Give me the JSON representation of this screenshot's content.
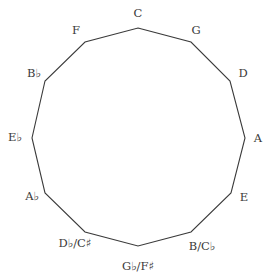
{
  "stroke_color": "#3a3a3a",
  "nodes": [
    {
      "label": "C",
      "x": 138,
      "y": 28,
      "lx": 138,
      "ly": 17
    },
    {
      "label": "G",
      "x": 191,
      "y": 42,
      "lx": 196,
      "ly": 34
    },
    {
      "label": "D",
      "x": 230,
      "y": 81,
      "lx": 243,
      "ly": 77
    },
    {
      "label": "A",
      "x": 245,
      "y": 138,
      "lx": 258,
      "ly": 142
    },
    {
      "label": "E",
      "x": 231,
      "y": 193,
      "lx": 244,
      "ly": 201
    },
    {
      "label": "B/C♭",
      "x": 191,
      "y": 232,
      "lx": 202,
      "ly": 250
    },
    {
      "label": "G♭/F♯",
      "x": 138,
      "y": 246,
      "lx": 138,
      "ly": 270
    },
    {
      "label": "D♭/C♯",
      "x": 85,
      "y": 232,
      "lx": 75,
      "ly": 247
    },
    {
      "label": "A♭",
      "x": 45,
      "y": 193,
      "lx": 32,
      "ly": 200
    },
    {
      "label": "E♭",
      "x": 32,
      "y": 138,
      "lx": 15,
      "ly": 141
    },
    {
      "label": "B♭",
      "x": 45,
      "y": 81,
      "lx": 34,
      "ly": 77
    },
    {
      "label": "F",
      "x": 85,
      "y": 42,
      "lx": 76,
      "ly": 34
    }
  ]
}
